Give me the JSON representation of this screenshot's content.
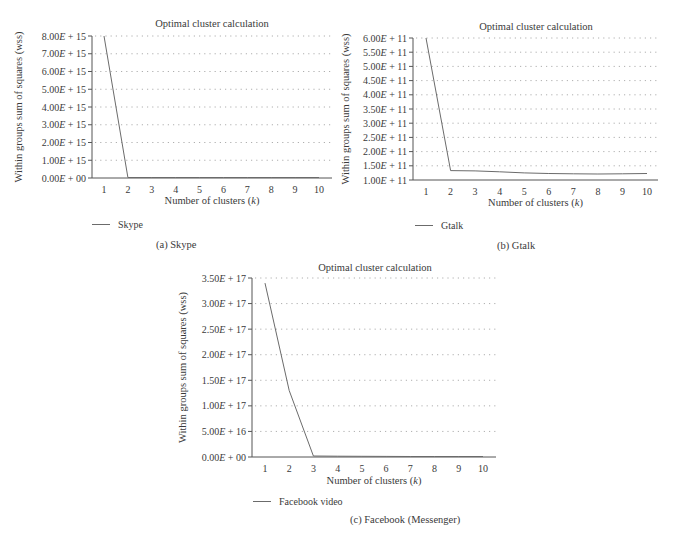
{
  "chart_data": [
    {
      "id": "a",
      "type": "line",
      "title": "Optimal cluster calculation",
      "xlabel": "Number of clusters (k)",
      "ylabel": "Within groups sum of squares (wss)",
      "x": [
        1,
        2,
        3,
        4,
        5,
        6,
        7,
        8,
        9,
        10
      ],
      "series": [
        {
          "name": "Skype",
          "values": [
            8000000000000000.0,
            20000000000000.0,
            15000000000000.0,
            12000000000000.0,
            10000000000000.0,
            8000000000000.0,
            6000000000000.0,
            5000000000000.0,
            4000000000000.0,
            3000000000000.0
          ]
        }
      ],
      "ylim": [
        0,
        8000000000000000.0
      ],
      "yticks": [
        "0.00E + 00",
        "1.00E + 15",
        "2.00E + 15",
        "3.00E + 15",
        "4.00E + 15",
        "5.00E + 15",
        "6.00E + 15",
        "7.00E + 15",
        "8.00E + 15"
      ],
      "xticks": [
        "1",
        "2",
        "3",
        "4",
        "5",
        "6",
        "7",
        "8",
        "9",
        "10"
      ],
      "grid": true,
      "legend_position": "bottom-left",
      "caption": "(a)  Skype"
    },
    {
      "id": "b",
      "type": "line",
      "title": "Optimal cluster calculation",
      "xlabel": "Number of clusters (k)",
      "ylabel": "Within groups sum of squares (wss)",
      "x": [
        1,
        2,
        3,
        4,
        5,
        6,
        7,
        8,
        9,
        10
      ],
      "series": [
        {
          "name": "Gtalk",
          "values": [
            600000000000.0,
            133000000000.0,
            132000000000.0,
            129000000000.0,
            125000000000.0,
            123000000000.0,
            122000000000.0,
            121000000000.0,
            122000000000.0,
            123000000000.0
          ]
        }
      ],
      "ylim": [
        100000000000.0,
        600000000000.0
      ],
      "yticks": [
        "1.00E + 11",
        "1.50E + 11",
        "2.00E + 11",
        "2.50E + 11",
        "3.00E + 11",
        "3.50E + 11",
        "4.00E + 11",
        "4.50E + 11",
        "5.00E + 11",
        "5.50E + 11",
        "6.00E + 11"
      ],
      "xticks": [
        "1",
        "2",
        "3",
        "4",
        "5",
        "6",
        "7",
        "8",
        "9",
        "10"
      ],
      "grid": true,
      "legend_position": "bottom-left",
      "caption": "(b)  Gtalk"
    },
    {
      "id": "c",
      "type": "line",
      "title": "Optimal cluster calculation",
      "xlabel": "Number of clusters (k)",
      "ylabel": "Within groups sum of squares (wss)",
      "x": [
        1,
        2,
        3,
        4,
        5,
        6,
        7,
        8,
        9,
        10
      ],
      "series": [
        {
          "name": "Facebook video",
          "values": [
            3.4e+17,
            1.3e+17,
            2000000000000000.0,
            1600000000000000.0,
            1300000000000000.0,
            1100000000000000.0,
            900000000000000.0,
            800000000000000.0,
            700000000000000.0,
            600000000000000.0
          ]
        }
      ],
      "ylim": [
        0,
        3.5e+17
      ],
      "yticks": [
        "0.00E + 00",
        "5.00E + 16",
        "1.00E + 17",
        "1.50E + 17",
        "2.00E + 17",
        "2.50E + 17",
        "3.00E + 17",
        "3.50E + 17"
      ],
      "xticks": [
        "1",
        "2",
        "3",
        "4",
        "5",
        "6",
        "7",
        "8",
        "9",
        "10"
      ],
      "grid": true,
      "legend_position": "bottom-left",
      "caption": "(c)  Facebook (Messenger)"
    }
  ],
  "layout": [
    {
      "x0": 92,
      "x1": 332,
      "y_top": 36,
      "y_bot": 178,
      "xfirst": 104,
      "xlast": 319,
      "title_x": 212,
      "title_y": 27,
      "xlabel_y": 204,
      "legend_y": 228,
      "legend_x": 92,
      "caption_x": 156,
      "caption_y": 248,
      "ylabel_x": 22
    },
    {
      "x0": 413,
      "x1": 658,
      "y_top": 38,
      "y_bot": 180,
      "xfirst": 426,
      "xlast": 647,
      "title_x": 536,
      "title_y": 30,
      "xlabel_y": 206,
      "legend_y": 229,
      "legend_x": 415,
      "caption_x": 497,
      "caption_y": 249,
      "ylabel_x": 349
    },
    {
      "x0": 252,
      "x1": 496,
      "y_top": 278,
      "y_bot": 457,
      "xfirst": 265,
      "xlast": 483,
      "title_x": 375,
      "title_y": 271,
      "xlabel_y": 484,
      "legend_y": 505,
      "legend_x": 253,
      "caption_x": 350,
      "caption_y": 523,
      "ylabel_x": 186
    }
  ]
}
